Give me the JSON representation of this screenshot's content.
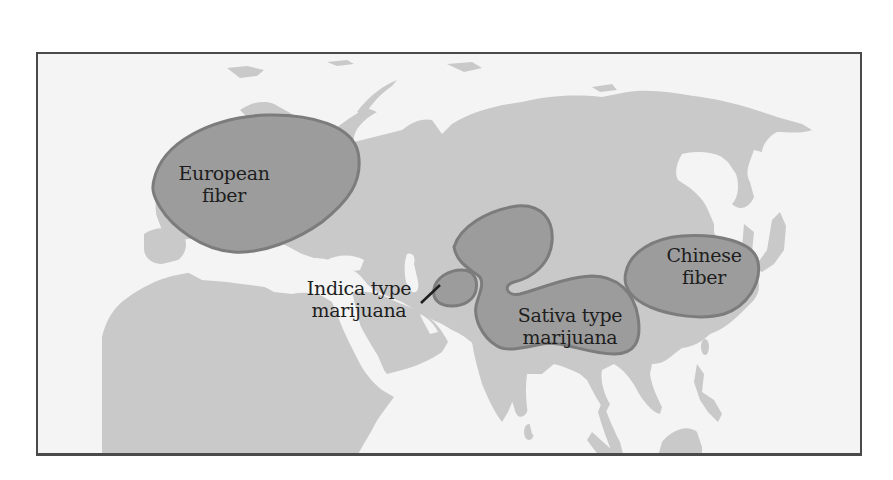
{
  "map": {
    "title": "",
    "colors": {
      "background": "#f4f4f4",
      "land": "#c9c9c9",
      "region_fill": "#9c9c9c",
      "region_outline": "#7c7c7c",
      "frame": "#4a4a4a",
      "text": "#1e1e1e"
    },
    "regions": [
      {
        "id": "european-fiber",
        "line1": "European",
        "line2": "fiber"
      },
      {
        "id": "indica-type-marijuana",
        "line1": "Indica type",
        "line2": "marijuana"
      },
      {
        "id": "sativa-type-marijuana",
        "line1": "Sativa type",
        "line2": "marijuana"
      },
      {
        "id": "chinese-fiber",
        "line1": "Chinese",
        "line2": "fiber"
      }
    ]
  }
}
